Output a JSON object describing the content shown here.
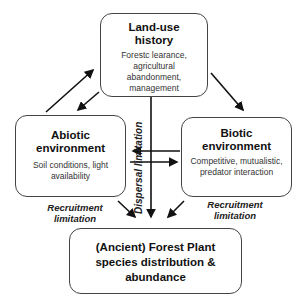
{
  "nodes": {
    "landuse": {
      "title": "Land-use history",
      "desc": "Forestc learance, agricultural abandonment, management"
    },
    "abiotic": {
      "title": "Abiotic environment",
      "desc": "Soil conditions, light availability"
    },
    "biotic": {
      "title": "Biotic environment",
      "desc": "Competitive, mutualistic, predator interaction"
    },
    "outcome": {
      "title": "(Ancient) Forest Plant species distribution & abundance"
    }
  },
  "edge_labels": {
    "dispersal": "Dispersal limitation",
    "recruitment_left": "Recruitment limitation",
    "recruitment_right": "Recruitment limitation"
  },
  "edges": [
    {
      "from": "abiotic",
      "to": "landuse"
    },
    {
      "from": "landuse",
      "to": "abiotic"
    },
    {
      "from": "landuse",
      "to": "biotic"
    },
    {
      "from": "landuse",
      "to": "outcome"
    },
    {
      "from": "biotic",
      "to": "abiotic"
    },
    {
      "from": "abiotic",
      "to": "biotic"
    },
    {
      "from": "abiotic",
      "to": "outcome"
    },
    {
      "from": "biotic",
      "to": "outcome"
    }
  ]
}
